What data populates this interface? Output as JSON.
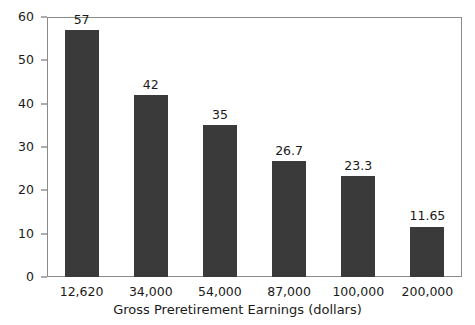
{
  "chart_data": {
    "type": "bar",
    "title": "",
    "xlabel": "Gross Preretirement Earnings (dollars)",
    "ylabel": "",
    "categories": [
      "12,620",
      "34,000",
      "54,000",
      "87,000",
      "100,000",
      "200,000"
    ],
    "values": [
      57,
      42,
      35,
      26.7,
      23.3,
      11.65
    ],
    "value_labels": [
      "57",
      "42",
      "35",
      "26.7",
      "23.3",
      "11.65"
    ],
    "ylim": [
      0,
      60
    ],
    "yticks": [
      0,
      10,
      20,
      30,
      40,
      50,
      60
    ],
    "ytick_labels": [
      "0",
      "10",
      "20",
      "30",
      "40",
      "50",
      "60"
    ],
    "grid": false,
    "legend": null,
    "bar_color": "#3a3a3a",
    "frame_color": "#8a8a8a",
    "background_color": "#ffffff"
  }
}
